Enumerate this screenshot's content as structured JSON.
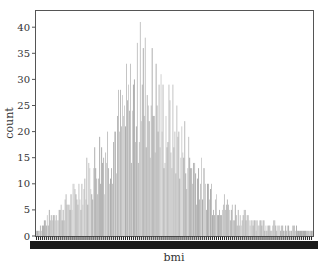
{
  "chart_data": {
    "type": "bar",
    "title": "",
    "xlabel": "bmi",
    "ylabel": "count",
    "ylim": [
      0,
      43
    ],
    "yticks": [
      0,
      5,
      10,
      15,
      20,
      25,
      30,
      35,
      40
    ],
    "grid": false,
    "legend": null,
    "bar_color": "#a0a0a0",
    "x_tick_labels_note": "hundreds of overlapping category labels render as a solid dark band",
    "n_categories": 280,
    "envelope": {
      "description": "approximate max count per region of the bmi axis (left to right)",
      "x_fraction": [
        0.0,
        0.05,
        0.1,
        0.15,
        0.2,
        0.25,
        0.3,
        0.35,
        0.4,
        0.45,
        0.5,
        0.55,
        0.6,
        0.65,
        0.7,
        0.75,
        0.8,
        0.85,
        0.9,
        0.95,
        1.0
      ],
      "peak_count": [
        1,
        5,
        8,
        12,
        18,
        24,
        30,
        37,
        41,
        34,
        29,
        22,
        15,
        11,
        8,
        5,
        4,
        3,
        2,
        2,
        1
      ]
    }
  },
  "axes": {
    "xlabel": "bmi",
    "ylabel": "count",
    "yticks": [
      "0",
      "5",
      "10",
      "15",
      "20",
      "25",
      "30",
      "35",
      "40"
    ]
  }
}
